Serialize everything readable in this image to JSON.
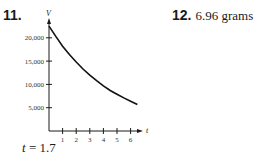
{
  "problem_11": {
    "number": "11.",
    "answer_var": "t",
    "answer_eq": " = 1.7"
  },
  "problem_12": {
    "number": "12.",
    "answer": "6.96 grams"
  },
  "chart_data": {
    "type": "line",
    "title": "",
    "xlabel": "t",
    "ylabel": "V",
    "xlim": [
      0,
      6.7
    ],
    "ylim": [
      0,
      24000
    ],
    "x_ticks": [
      1,
      2,
      3,
      4,
      5,
      6
    ],
    "x_tick_labels": [
      "1",
      "2",
      "3",
      "4",
      "5",
      "6"
    ],
    "y_ticks": [
      5000,
      10000,
      15000,
      20000
    ],
    "y_tick_labels": [
      "5,000",
      "10,000",
      "15,000",
      "20,000"
    ],
    "grid": false,
    "series": [
      {
        "name": "V(t)",
        "x": [
          0,
          0.5,
          1,
          1.5,
          2,
          2.5,
          3,
          3.5,
          4,
          4.5,
          5,
          5.5,
          6,
          6.5
        ],
        "values": [
          22500,
          20300,
          18200,
          16400,
          14800,
          13300,
          12000,
          10800,
          9700,
          8700,
          7900,
          7100,
          6400,
          5700
        ]
      }
    ]
  }
}
